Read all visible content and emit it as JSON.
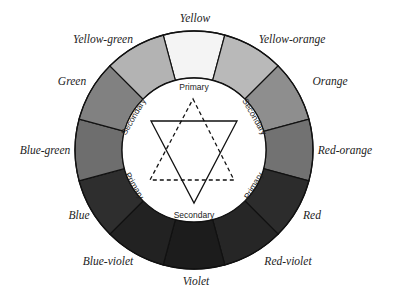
{
  "diagram": {
    "center": [
      194,
      150
    ],
    "outer_radius": 119,
    "inner_radius": 72,
    "segment_stroke": "#111111",
    "segments": [
      {
        "name": "Yellow",
        "angle": -90,
        "fill": "#f4f4f4",
        "label_pos": [
          195,
          19
        ]
      },
      {
        "name": "Yellow-orange",
        "angle": -60,
        "fill": "#b9b9b9",
        "label_pos": [
          292,
          40
        ]
      },
      {
        "name": "Orange",
        "angle": -30,
        "fill": "#8e8e8e",
        "label_pos": [
          330,
          82
        ]
      },
      {
        "name": "Red-orange",
        "angle": 0,
        "fill": "#727272",
        "label_pos": [
          345,
          151
        ]
      },
      {
        "name": "Red",
        "angle": 30,
        "fill": "#2c2c2c",
        "label_pos": [
          312,
          216
        ]
      },
      {
        "name": "Red-violet",
        "angle": 60,
        "fill": "#262626",
        "label_pos": [
          288,
          262
        ]
      },
      {
        "name": "Violet",
        "angle": 90,
        "fill": "#1c1c1c",
        "label_pos": [
          196,
          282
        ]
      },
      {
        "name": "Blue-violet",
        "angle": 120,
        "fill": "#222222",
        "label_pos": [
          108,
          262
        ]
      },
      {
        "name": "Blue",
        "angle": 150,
        "fill": "#2e2e2e",
        "label_pos": [
          79,
          216
        ]
      },
      {
        "name": "Blue-green",
        "angle": 180,
        "fill": "#6e6e6e",
        "label_pos": [
          45,
          151
        ]
      },
      {
        "name": "Green",
        "angle": 210,
        "fill": "#818181",
        "label_pos": [
          72,
          82
        ]
      },
      {
        "name": "Yellow-green",
        "angle": 240,
        "fill": "#b3b3b3",
        "label_pos": [
          103,
          40
        ]
      }
    ],
    "inner_labels": [
      {
        "text": "Primary",
        "x": 194,
        "y": 88,
        "rotate": 0
      },
      {
        "text": "Secondary",
        "x": 134,
        "y": 117,
        "rotate": -60
      },
      {
        "text": "Secondary",
        "x": 254,
        "y": 117,
        "rotate": 60
      },
      {
        "text": "Primary",
        "x": 134,
        "y": 186,
        "rotate": 60
      },
      {
        "text": "Primary",
        "x": 254,
        "y": 186,
        "rotate": -60
      },
      {
        "text": "Secondary",
        "x": 194,
        "y": 216,
        "rotate": 0
      }
    ],
    "solid_triangle": {
      "points": [
        [
          151,
          121
        ],
        [
          237,
          121
        ],
        [
          194,
          203
        ]
      ],
      "style": "solid"
    },
    "dashed_triangle": {
      "points": [
        [
          193,
          99
        ],
        [
          234,
          180
        ],
        [
          150,
          180
        ]
      ],
      "style": "dashed"
    }
  }
}
